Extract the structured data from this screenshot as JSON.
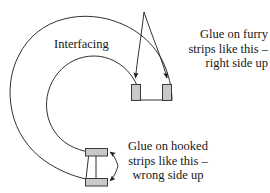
{
  "figure": {
    "background_color": "#ffffff",
    "ink_color": "#1a1a1a",
    "strip_fill_color": "#c9c9c9",
    "strip_stroke_color": "#3a3a3a"
  },
  "labels": {
    "interfacing": "Interfacing"
  },
  "callouts": {
    "furry": {
      "line1": "Glue on furry",
      "line2": "strips like this –",
      "line3": "right side up",
      "align": "right"
    },
    "hooked": {
      "line1": "Glue on hooked",
      "line2": "strips like this –",
      "line3": "wrong side up",
      "align": "center"
    }
  },
  "shapes": {
    "interfacing_outline": "C-shaped annulus open at right",
    "strips": [
      {
        "name": "furry-strip-left",
        "orientation": "vertical"
      },
      {
        "name": "furry-strip-right",
        "orientation": "vertical"
      },
      {
        "name": "hooked-strip-top",
        "orientation": "horizontal"
      },
      {
        "name": "hooked-strip-bottom",
        "orientation": "horizontal"
      }
    ],
    "leader_lines": [
      {
        "name": "furry-leader-left",
        "has_arrowhead": true
      },
      {
        "name": "furry-leader-right",
        "has_arrowhead": true
      },
      {
        "name": "hooked-leader-top",
        "has_arrowhead": true
      },
      {
        "name": "hooked-leader-bottom",
        "has_arrowhead": true
      }
    ]
  }
}
